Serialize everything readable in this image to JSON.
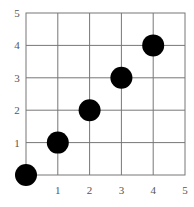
{
  "chart_data": {
    "type": "scatter",
    "title": "",
    "xlabel": "",
    "ylabel": "",
    "xlim": [
      0,
      5
    ],
    "ylim": [
      0,
      5
    ],
    "grid": true,
    "x_ticks": [
      "1",
      "2",
      "3",
      "4",
      "5"
    ],
    "y_ticks": [
      "1",
      "2",
      "3",
      "4",
      "5"
    ],
    "series": [
      {
        "name": "points",
        "x": [
          0,
          1,
          2,
          3,
          4
        ],
        "y": [
          0,
          1,
          2,
          3,
          4
        ],
        "color": "#000000"
      }
    ],
    "colors": {
      "grid": "#777777",
      "marker": "#000000",
      "tick_label": "#555555"
    }
  }
}
